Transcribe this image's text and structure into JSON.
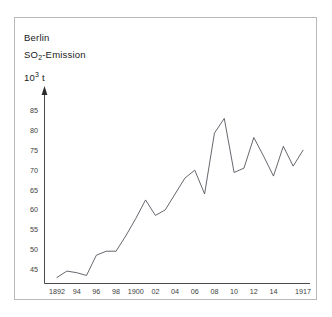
{
  "figure": {
    "title_lines": [
      "Berlin",
      "SO2-Emission",
      "10^3 t"
    ],
    "title_line_1": "Berlin",
    "title_line_2_main": "SO",
    "title_line_2_sub": "2",
    "title_line_2_tail": "-Emission",
    "title_line_3_main": "10",
    "title_line_3_sup": "3",
    "title_line_3_tail": " t",
    "border_color": "#b9b9b9",
    "line_color": "#55555e",
    "axis_color": "#4a4a4a",
    "background": "#ffffff"
  },
  "chart_data": {
    "type": "line",
    "title": "Berlin SO2-Emission",
    "xlabel": "",
    "ylabel": "10^3 t",
    "xlim": [
      1891,
      1918
    ],
    "ylim": [
      42,
      88
    ],
    "grid": false,
    "legend": "none",
    "y_ticks": [
      45,
      50,
      55,
      60,
      65,
      70,
      75,
      80,
      85
    ],
    "y_tick_labels": [
      "45",
      "50",
      "55",
      "60",
      "65",
      "70",
      "75",
      "80",
      "85"
    ],
    "x_ticks": [
      1892,
      1894,
      1896,
      1898,
      1900,
      1902,
      1904,
      1906,
      1908,
      1910,
      1912,
      1914,
      1917
    ],
    "x_tick_labels": [
      "1892",
      "94",
      "96",
      "98",
      "1900",
      "02",
      "04",
      "06",
      "08",
      "10",
      "12",
      "14",
      "1917"
    ],
    "x": [
      1892,
      1893,
      1894,
      1895,
      1896,
      1897,
      1898,
      1899,
      1900,
      1901,
      1902,
      1903,
      1904,
      1905,
      1906,
      1907,
      1908,
      1909,
      1910,
      1911,
      1912,
      1913,
      1914,
      1915,
      1916,
      1917
    ],
    "series": [
      {
        "name": "SO2-Emission",
        "values": [
          43.0,
          44.6,
          44.2,
          43.5,
          48.6,
          49.6,
          49.6,
          53.5,
          57.8,
          62.5,
          58.6,
          60.0,
          64.0,
          68.0,
          70.0,
          64.0,
          79.3,
          83.0,
          69.4,
          70.5,
          78.2,
          73.5,
          68.5,
          76.0,
          71.0,
          75.0
        ]
      }
    ]
  }
}
